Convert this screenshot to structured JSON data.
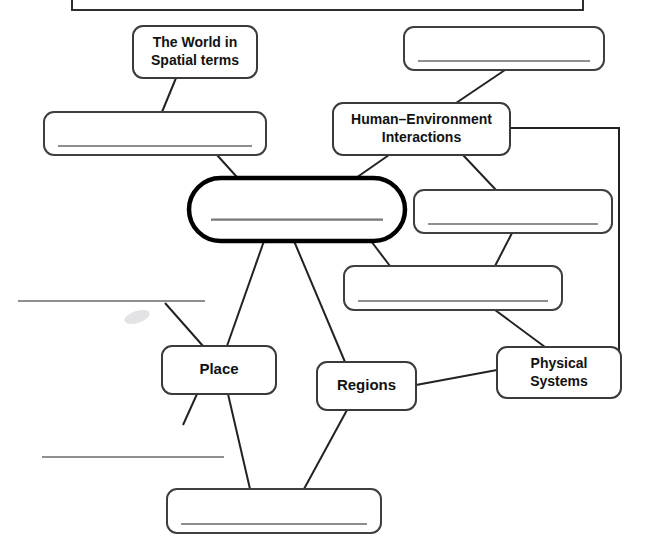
{
  "document": {
    "title": "Geography Themes Concept Map",
    "type": "fill-in-the-blank concept map worksheet",
    "background_color": "#ffffff",
    "ink_color": "#222222",
    "blank_line_color": "#8d8d92"
  },
  "nodes": [
    {
      "id": "top-banner",
      "name": "top-banner-box",
      "label": "",
      "filled": false,
      "shape": "rectangle",
      "x": 72,
      "y": -26,
      "w": 511,
      "h": 36,
      "has_write_line": false
    },
    {
      "id": "world-spatial",
      "name": "node-world-in-spatial-terms",
      "label": "The World in\nSpatial terms",
      "lines": [
        "The World in",
        "Spatial terms"
      ],
      "filled": true,
      "shape": "rounded",
      "x": 133,
      "y": 26,
      "w": 124,
      "h": 52,
      "font_size": 14,
      "has_write_line": false
    },
    {
      "id": "blank-top-right",
      "name": "node-blank-top-right",
      "label": "",
      "filled": false,
      "shape": "rounded",
      "x": 404,
      "y": 27,
      "w": 200,
      "h": 43,
      "has_write_line": true
    },
    {
      "id": "blank-left-upper",
      "name": "node-blank-left-upper",
      "label": "",
      "filled": false,
      "shape": "rounded",
      "x": 44,
      "y": 112,
      "w": 222,
      "h": 43,
      "has_write_line": true
    },
    {
      "id": "human-environment",
      "name": "node-human-environment-interactions",
      "label": "Human–Environment\nInteractions",
      "lines": [
        "Human–Environment",
        "Interactions"
      ],
      "filled": true,
      "shape": "rounded",
      "x": 333,
      "y": 103,
      "w": 177,
      "h": 52,
      "font_size": 14,
      "has_write_line": false
    },
    {
      "id": "center-blank",
      "name": "node-center-blank-geography",
      "label": "",
      "filled": false,
      "shape": "pill",
      "x": 189,
      "y": 178,
      "w": 216,
      "h": 63,
      "has_write_line": true,
      "emphasis": "thick-border"
    },
    {
      "id": "blank-right-mid",
      "name": "node-blank-right-middle",
      "label": "",
      "filled": false,
      "shape": "rounded",
      "x": 414,
      "y": 190,
      "w": 198,
      "h": 43,
      "has_write_line": true
    },
    {
      "id": "blank-center-lower",
      "name": "node-blank-center-lower",
      "label": "",
      "filled": false,
      "shape": "rounded",
      "x": 344,
      "y": 266,
      "w": 218,
      "h": 44,
      "has_write_line": true
    },
    {
      "id": "place",
      "name": "node-place",
      "label": "Place",
      "lines": [
        "Place"
      ],
      "filled": true,
      "shape": "rounded",
      "x": 162,
      "y": 346,
      "w": 114,
      "h": 48,
      "font_size": 15,
      "has_write_line": false
    },
    {
      "id": "regions",
      "name": "node-regions",
      "label": "Regions",
      "lines": [
        "Regions"
      ],
      "filled": true,
      "shape": "rounded",
      "x": 317,
      "y": 362,
      "w": 99,
      "h": 48,
      "font_size": 15,
      "has_write_line": false
    },
    {
      "id": "physical-systems",
      "name": "node-physical-systems",
      "label": "Physical\nSystems",
      "lines": [
        "Physical",
        "Systems"
      ],
      "filled": true,
      "shape": "rounded",
      "x": 497,
      "y": 347,
      "w": 124,
      "h": 51,
      "font_size": 14,
      "has_write_line": false
    },
    {
      "id": "blank-bottom",
      "name": "node-blank-bottom",
      "label": "",
      "filled": false,
      "shape": "rounded",
      "x": 167,
      "y": 489,
      "w": 214,
      "h": 44,
      "has_write_line": true
    },
    {
      "id": "blank-left-cut-upper",
      "name": "node-blank-left-cutoff-upper",
      "label": "",
      "filled": false,
      "shape": "cut-off-line",
      "x": 18,
      "y": 301,
      "w": 187,
      "h": 0,
      "has_write_line": true
    },
    {
      "id": "blank-left-cut-lower",
      "name": "node-blank-left-cutoff-lower",
      "label": "",
      "filled": false,
      "shape": "cut-off-line",
      "x": 42,
      "y": 457,
      "w": 182,
      "h": 0,
      "has_write_line": true
    }
  ],
  "connectors": [
    {
      "name": "connector-world-spatial-to-blank-left-upper",
      "from": "world-spatial",
      "to": "blank-left-upper",
      "x1": 176,
      "y1": 78,
      "x2": 162,
      "y2": 112
    },
    {
      "name": "connector-blank-left-upper-to-center",
      "from": "blank-left-upper",
      "to": "center-blank",
      "x1": 217,
      "y1": 155,
      "x2": 245,
      "y2": 186
    },
    {
      "name": "connector-blank-top-right-to-human-environment",
      "from": "blank-top-right",
      "to": "human-environment",
      "x1": 505,
      "y1": 70,
      "x2": 456,
      "y2": 103
    },
    {
      "name": "connector-human-environment-to-center",
      "from": "human-environment",
      "to": "center-blank",
      "x1": 389,
      "y1": 155,
      "x2": 353,
      "y2": 180
    },
    {
      "name": "connector-human-environment-to-blank-right-mid",
      "from": "human-environment",
      "to": "blank-right-mid",
      "x1": 463,
      "y1": 155,
      "x2": 496,
      "y2": 190
    },
    {
      "name": "connector-human-environment-to-physical-systems-right-rail",
      "from": "human-environment",
      "to": "physical-systems",
      "path": "M 510 128 L 619 128 L 619 352 L 586 352"
    },
    {
      "name": "connector-blank-right-mid-to-blank-center-lower",
      "from": "blank-right-mid",
      "to": "blank-center-lower",
      "x1": 512,
      "y1": 233,
      "x2": 495,
      "y2": 266
    },
    {
      "name": "connector-center-to-blank-center-lower",
      "from": "center-blank",
      "to": "blank-center-lower",
      "x1": 371,
      "y1": 241,
      "x2": 390,
      "y2": 266
    },
    {
      "name": "connector-blank-center-lower-to-physical-systems",
      "from": "blank-center-lower",
      "to": "physical-systems",
      "x1": 495,
      "y1": 310,
      "x2": 545,
      "y2": 347
    },
    {
      "name": "connector-center-to-place",
      "from": "center-blank",
      "to": "place",
      "x1": 264,
      "y1": 241,
      "x2": 227,
      "y2": 346
    },
    {
      "name": "connector-center-to-regions",
      "from": "center-blank",
      "to": "regions",
      "x1": 294,
      "y1": 241,
      "x2": 345,
      "y2": 362
    },
    {
      "name": "connector-blank-left-cutoff-upper-to-place",
      "from": "blank-left-cut-upper",
      "to": "place",
      "x1": 165,
      "y1": 303,
      "x2": 203,
      "y2": 346
    },
    {
      "name": "connector-place-to-blank-left-cutoff-lower",
      "from": "place",
      "to": "blank-left-cut-lower",
      "x1": 197,
      "y1": 394,
      "x2": 183,
      "y2": 425
    },
    {
      "name": "connector-place-to-blank-bottom",
      "from": "place",
      "to": "blank-bottom",
      "x1": 228,
      "y1": 394,
      "x2": 250,
      "y2": 489
    },
    {
      "name": "connector-regions-to-blank-bottom",
      "from": "regions",
      "to": "blank-bottom",
      "x1": 347,
      "y1": 410,
      "x2": 304,
      "y2": 489
    },
    {
      "name": "connector-regions-to-physical-systems",
      "from": "regions",
      "to": "physical-systems",
      "x1": 416,
      "y1": 385,
      "x2": 497,
      "y2": 370
    }
  ],
  "artifacts": [
    {
      "name": "scan-smudge",
      "x": 124,
      "y": 311,
      "w": 26,
      "h": 12
    }
  ]
}
